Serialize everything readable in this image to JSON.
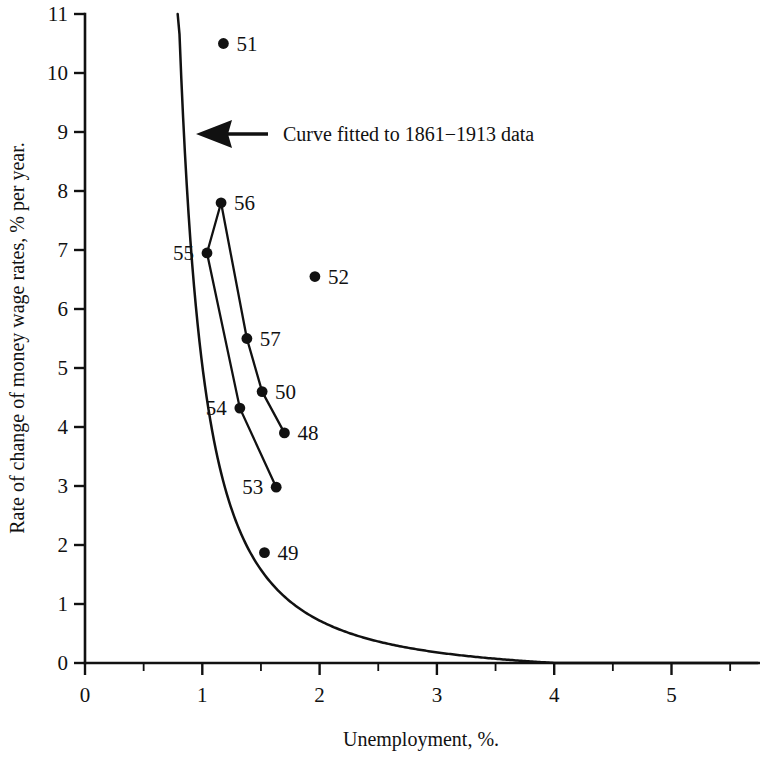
{
  "chart_data": {
    "type": "scatter",
    "title": "",
    "xlabel": "Unemployment,  %.",
    "ylabel": "Rate of change of money wage rates, % per year.",
    "xlim": [
      0,
      5.75
    ],
    "ylim": [
      0,
      11
    ],
    "grid": false,
    "legend": "none",
    "x_ticks_major": [
      0,
      1,
      2,
      3,
      4,
      5
    ],
    "x_tick_labels": [
      "0",
      "1",
      "2",
      "3",
      "4",
      "5"
    ],
    "x_ticks_minor": [
      0.5,
      1.5,
      2.5,
      3.5,
      4.5,
      5.5
    ],
    "y_ticks_major": [
      0,
      1,
      2,
      3,
      4,
      5,
      6,
      7,
      8,
      9,
      10,
      11
    ],
    "y_tick_labels": [
      "0",
      "1",
      "2",
      "3",
      "4",
      "5",
      "6",
      "7",
      "8",
      "9",
      "10",
      "11"
    ],
    "annotations": [
      {
        "name": "fitted-curve-annotation",
        "text": "Curve fitted to 1861−1913 data",
        "points_to": "fitted-curve"
      }
    ],
    "series": [
      {
        "name": "Annual observations 1948-1957",
        "marker": "filled-circle",
        "points": [
          {
            "label": "48",
            "x": 1.7,
            "y": 3.9,
            "label_side": "right"
          },
          {
            "label": "49",
            "x": 1.53,
            "y": 1.87,
            "label_side": "right"
          },
          {
            "label": "50",
            "x": 1.51,
            "y": 4.6,
            "label_side": "right"
          },
          {
            "label": "51",
            "x": 1.18,
            "y": 10.5,
            "label_side": "right"
          },
          {
            "label": "52",
            "x": 1.96,
            "y": 6.55,
            "label_side": "right"
          },
          {
            "label": "53",
            "x": 1.63,
            "y": 2.98,
            "label_side": "left"
          },
          {
            "label": "54",
            "x": 1.32,
            "y": 4.32,
            "label_side": "left"
          },
          {
            "label": "55",
            "x": 1.04,
            "y": 6.95,
            "label_side": "left"
          },
          {
            "label": "56",
            "x": 1.16,
            "y": 7.8,
            "label_side": "right"
          },
          {
            "label": "57",
            "x": 1.38,
            "y": 5.5,
            "label_side": "right"
          }
        ],
        "connections": [
          [
            "55",
            "56",
            "57",
            "50",
            "48"
          ],
          [
            "55",
            "54",
            "53"
          ]
        ]
      }
    ],
    "fitted_curve": {
      "name": "Curve fitted to 1861-1913 data",
      "description": "Phillips relation fitted to 1861-1913 data",
      "x_start": 0.79,
      "x_end": 5.75,
      "y_at_x_start": 11.0,
      "y_at_x_end": 0.05
    }
  },
  "colors": {
    "ink": "#111111",
    "background": "#ffffff"
  }
}
